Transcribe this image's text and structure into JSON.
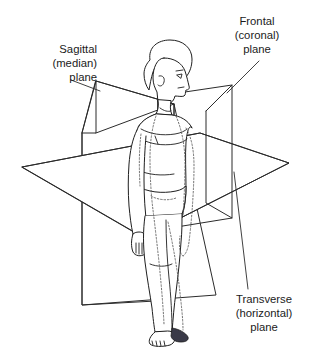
{
  "figure": {
    "background_color": "#ffffff",
    "line_color": "#2b2b2b",
    "text_color": "#1b1b1b",
    "labels": [
      {
        "id": "sagittal",
        "lines": [
          "Sagittal",
          "(median)",
          "plane"
        ],
        "align": "right",
        "x": 97,
        "y": 49
      },
      {
        "id": "frontal",
        "lines": [
          "Frontal",
          "(coronal)",
          "plane"
        ],
        "align": "center",
        "x": 257,
        "y": 21
      },
      {
        "id": "transverse",
        "lines": [
          "Transverse",
          "(horizontal)",
          "plane"
        ],
        "align": "center",
        "x": 264,
        "y": 303
      }
    ],
    "planes": [
      {
        "id": "sagittal-plane",
        "name": "Sagittal (median) plane",
        "orientation": "vertical-longitudinal"
      },
      {
        "id": "frontal-plane",
        "name": "Frontal (coronal) plane",
        "orientation": "vertical-transverse"
      },
      {
        "id": "transverse-plane",
        "name": "Transverse (horizontal) plane",
        "orientation": "horizontal"
      }
    ],
    "leaders": [
      {
        "id": "sagittal-leader",
        "from": [
          71,
          80
        ],
        "to": [
          100,
          91
        ]
      },
      {
        "id": "frontal-leader",
        "from": [
          259,
          61
        ],
        "to": [
          227,
          93
        ]
      },
      {
        "id": "transverse-leader",
        "from": [
          248,
          289
        ],
        "to": [
          234,
          172
        ]
      }
    ]
  }
}
